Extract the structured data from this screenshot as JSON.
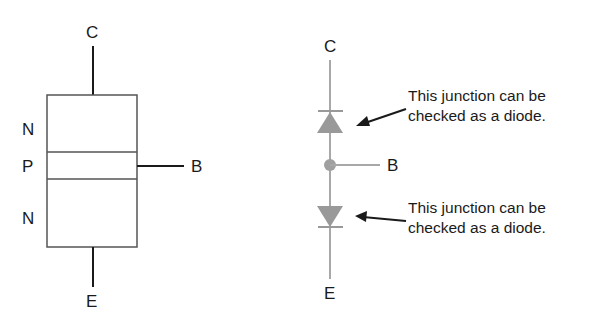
{
  "left_diagram": {
    "title": "NPN transistor layer structure",
    "terminals": {
      "collector": "C",
      "base": "B",
      "emitter": "E"
    },
    "layers": [
      "N",
      "P",
      "N"
    ]
  },
  "right_diagram": {
    "title": "Two-diode equivalent",
    "terminals": {
      "collector": "C",
      "base": "B",
      "emitter": "E"
    },
    "annotations": [
      {
        "line1": "This junction can be",
        "line2": "checked as a diode."
      },
      {
        "line1": "This junction can be",
        "line2": "checked as a diode."
      }
    ],
    "diode_color": "#999999"
  }
}
